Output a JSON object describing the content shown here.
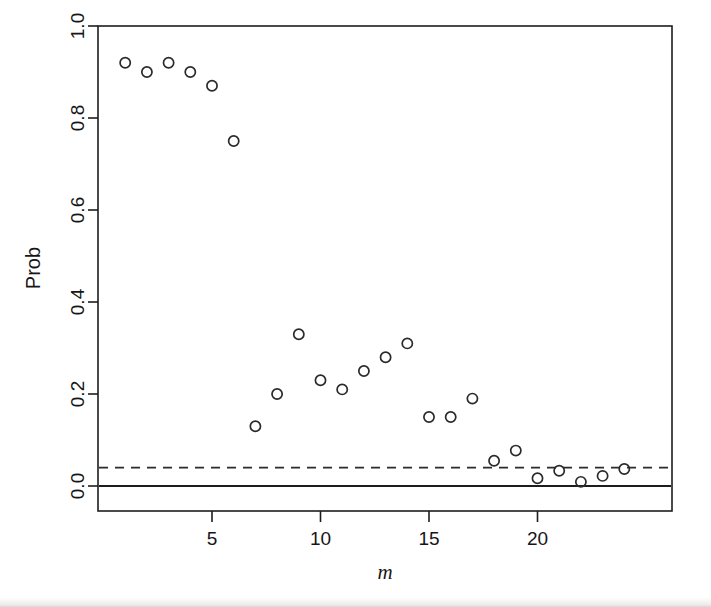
{
  "figure": {
    "kind": "scatter-plot",
    "background_color": "#ffffff",
    "foreground_color": "#1d1d1d"
  },
  "chart_data": {
    "type": "scatter",
    "title": "",
    "subtitle": "",
    "xlabel": "m",
    "ylabel": "Prob",
    "xlim": [
      0.3,
      24.7
    ],
    "ylim": [
      -0.04,
      1.04
    ],
    "grid": false,
    "legend": "none",
    "marker": "open-circle",
    "x": [
      1,
      2,
      3,
      4,
      5,
      6,
      7,
      8,
      9,
      10,
      11,
      12,
      13,
      14,
      15,
      16,
      17,
      18,
      19,
      20,
      21,
      22,
      23,
      24
    ],
    "y": [
      0.92,
      0.9,
      0.92,
      0.9,
      0.87,
      0.75,
      0.13,
      0.2,
      0.33,
      0.23,
      0.21,
      0.25,
      0.28,
      0.31,
      0.15,
      0.15,
      0.19,
      0.055,
      0.077,
      0.017,
      0.033,
      0.009,
      0.022,
      0.037
    ],
    "xticks": [
      5,
      10,
      15,
      20
    ],
    "xticklabels": [
      "5",
      "10",
      "15",
      "20"
    ],
    "yticks": [
      0.0,
      0.2,
      0.4,
      0.6,
      0.8,
      1.0
    ],
    "yticklabels": [
      "0.0",
      "0.2",
      "0.4",
      "0.6",
      "0.8",
      "1.0"
    ],
    "annotations": [
      {
        "name": "significance-threshold",
        "type": "horizontal-line",
        "style": "dashed",
        "y": 0.04,
        "label": ""
      },
      {
        "name": "zero-baseline",
        "type": "horizontal-line",
        "style": "solid",
        "y": 0.0,
        "label": ""
      }
    ]
  }
}
